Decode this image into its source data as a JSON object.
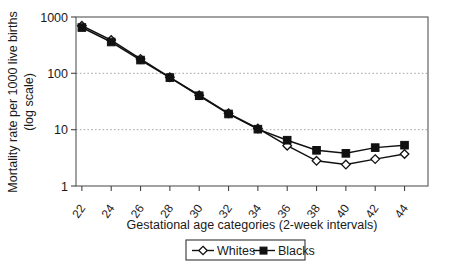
{
  "chart_data": {
    "type": "line",
    "title": "",
    "xlabel": "Gestational age categories (2-week intervals)",
    "ylabel": "Mortality rate per 1000 live births (log scale)",
    "ylabel_line1": "Mortality rate per 1000 live births",
    "ylabel_line2": "(log scale)",
    "yscale": "log",
    "ylim": [
      1,
      1000
    ],
    "ytick_labels": [
      "1000",
      "100",
      "10",
      "1"
    ],
    "ytick_values": [
      1000,
      100,
      10,
      1
    ],
    "grid": "horizontal-dotted",
    "legend_position": "below-axis-center",
    "categories": [
      "22",
      "24",
      "26",
      "28",
      "30",
      "32",
      "34",
      "36",
      "38",
      "40",
      "42",
      "44"
    ],
    "x": [
      22,
      24,
      26,
      28,
      30,
      32,
      34,
      36,
      38,
      40,
      42,
      44
    ],
    "series": [
      {
        "name": "Whites",
        "marker": "open-diamond",
        "values": [
          700,
          390,
          180,
          85,
          41,
          19.5,
          10.5,
          5.2,
          2.8,
          2.4,
          3.0,
          3.7
        ]
      },
      {
        "name": "Blacks",
        "marker": "filled-square",
        "values": [
          650,
          360,
          172,
          84,
          40,
          19,
          10.2,
          6.5,
          4.3,
          3.8,
          4.8,
          5.3
        ]
      }
    ]
  },
  "legend": {
    "entries": [
      {
        "label": "Whites",
        "marker": "open-diamond"
      },
      {
        "label": "Blacks",
        "marker": "filled-square"
      }
    ]
  },
  "axes": {
    "x_title": "Gestational age categories (2-week intervals)",
    "y_title_line1": "Mortality rate per 1000 live births",
    "y_title_line2": "(log scale)"
  }
}
